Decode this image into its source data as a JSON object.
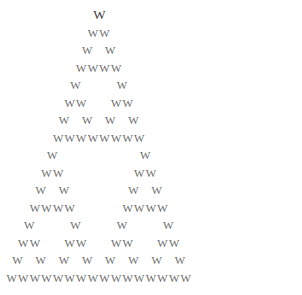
{
  "figure": {
    "glyph": "W",
    "glyph_name": "letter-w",
    "rows": 16,
    "background_color": "#ffffff",
    "glyph_color": "#6b6b6b",
    "apex_glyph_color": "#3c3c3c",
    "canvas_width": 302,
    "canvas_height": 295,
    "row_height": 17.5,
    "glyph_advance": 11.6,
    "origin_x": 12,
    "origin_y": 8,
    "rule": "binomial(n,k) mod 2"
  },
  "chart_data": {
    "type": "scatter",
    "xlabel": "",
    "ylabel": "",
    "grid": false,
    "legend": null,
    "glyph": "W",
    "rows": 16,
    "row_counts": [
      1,
      2,
      2,
      4,
      2,
      4,
      4,
      8,
      2,
      4,
      4,
      8,
      4,
      8,
      8,
      16
    ],
    "row_patterns": [
      "1",
      "11",
      "101",
      "1111",
      "10001",
      "110011",
      "1010101",
      "11111111",
      "100000001",
      "1100000011",
      "10100000101",
      "111100001111",
      "1000100010001",
      "11001100110011",
      "101010101010101",
      "1111111111111111"
    ],
    "x": [
      [
        7.5
      ],
      [
        7.0,
        8.0
      ],
      [
        6.5,
        8.5
      ],
      [
        6.0,
        7.0,
        8.0,
        9.0
      ],
      [
        5.5,
        9.5
      ],
      [
        5.0,
        6.0,
        9.0,
        10.0
      ],
      [
        4.5,
        6.5,
        8.5,
        10.5
      ],
      [
        4.0,
        5.0,
        6.0,
        7.0,
        8.0,
        9.0,
        10.0,
        11.0
      ],
      [
        3.5,
        11.5
      ],
      [
        3.0,
        4.0,
        11.0,
        12.0
      ],
      [
        2.5,
        4.5,
        10.5,
        12.5
      ],
      [
        2.0,
        3.0,
        4.0,
        5.0,
        10.0,
        11.0,
        12.0,
        13.0
      ],
      [
        1.5,
        5.5,
        9.5,
        13.5
      ],
      [
        1.0,
        2.0,
        5.0,
        6.0,
        9.0,
        10.0,
        13.0,
        14.0
      ],
      [
        0.5,
        2.5,
        4.5,
        6.5,
        8.5,
        10.5,
        12.5,
        14.5
      ],
      [
        0.0,
        1.0,
        2.0,
        3.0,
        4.0,
        5.0,
        6.0,
        7.0,
        8.0,
        9.0,
        10.0,
        11.0,
        12.0,
        13.0,
        14.0,
        15.0
      ]
    ],
    "xlim": [
      0,
      16
    ],
    "ylim": [
      0,
      16
    ],
    "total_glyphs": 81
  }
}
